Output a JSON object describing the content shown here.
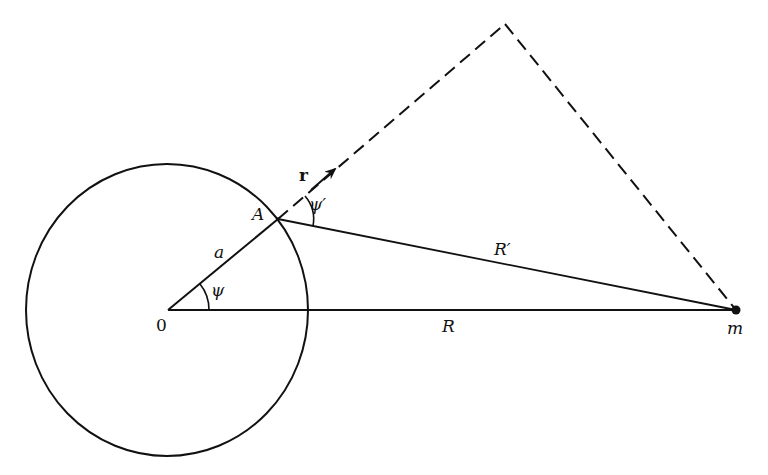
{
  "diagram": {
    "colors": {
      "ink": "#111111",
      "background": "#ffffff"
    },
    "labels": {
      "origin": "0",
      "point_A": "A",
      "radius": "a",
      "angle_psi": "ψ",
      "angle_psi_prime": "ψ′",
      "vector_r": "r",
      "distance_R": "R",
      "distance_R_prime": "R′",
      "mass": "m"
    }
  }
}
